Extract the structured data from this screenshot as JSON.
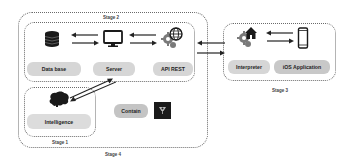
{
  "stages": {
    "stage1": "Stage 1",
    "stage2": "Stage 2",
    "stage3": "Stage 3",
    "stage4": "Stage 4"
  },
  "nodes": {
    "database": {
      "label": "Data base",
      "icon": "database-icon"
    },
    "server": {
      "label": "Server",
      "icon": "monitor-icon"
    },
    "api": {
      "label": "API REST",
      "icon": "gear-globe-icon"
    },
    "interpreter": {
      "label": "Interpreter",
      "icon": "gear-home-icon"
    },
    "ios": {
      "label": "iOS Application",
      "icon": "smartphone-icon"
    },
    "intelligence": {
      "label": "Intelligence",
      "icon": "brain-icon"
    },
    "contain": {
      "label": "Contain",
      "icon": "lamp-icon"
    }
  },
  "colors": {
    "pill": "#d6d6d6",
    "border": "#6a6a6a",
    "icon": "#1a1a1a",
    "gear": "#7a7a7a"
  }
}
